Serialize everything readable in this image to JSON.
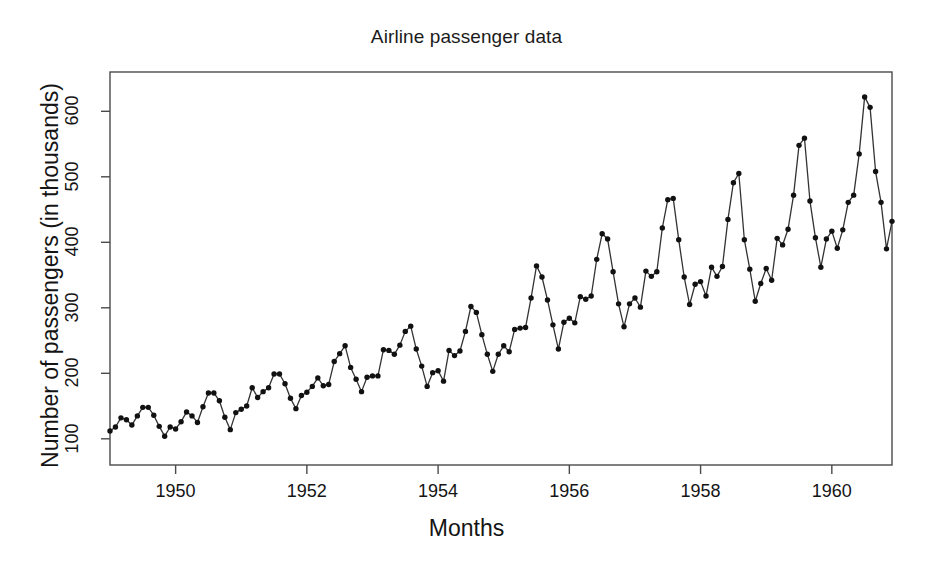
{
  "chart_data": {
    "type": "line",
    "title": "Airline passenger data",
    "xlabel": "Months",
    "ylabel": "Number of passengers (in thousands)",
    "grid": false,
    "legend": false,
    "marker": "filled-circle",
    "line_color": "#333333",
    "marker_color": "#111111",
    "xlim": [
      1949.0,
      1960.917
    ],
    "ylim": [
      60,
      660
    ],
    "xtick_values": [
      1950,
      1952,
      1954,
      1956,
      1958,
      1960
    ],
    "xtick_labels": [
      "1950",
      "1952",
      "1954",
      "1956",
      "1958",
      "1960"
    ],
    "ytick_values": [
      100,
      200,
      300,
      400,
      500,
      600
    ],
    "ytick_labels": [
      "100",
      "200",
      "300",
      "400",
      "500",
      "600"
    ],
    "x": [
      1949.0,
      1949.083,
      1949.167,
      1949.25,
      1949.333,
      1949.417,
      1949.5,
      1949.583,
      1949.667,
      1949.75,
      1949.833,
      1949.917,
      1950.0,
      1950.083,
      1950.167,
      1950.25,
      1950.333,
      1950.417,
      1950.5,
      1950.583,
      1950.667,
      1950.75,
      1950.833,
      1950.917,
      1951.0,
      1951.083,
      1951.167,
      1951.25,
      1951.333,
      1951.417,
      1951.5,
      1951.583,
      1951.667,
      1951.75,
      1951.833,
      1951.917,
      1952.0,
      1952.083,
      1952.167,
      1952.25,
      1952.333,
      1952.417,
      1952.5,
      1952.583,
      1952.667,
      1952.75,
      1952.833,
      1952.917,
      1953.0,
      1953.083,
      1953.167,
      1953.25,
      1953.333,
      1953.417,
      1953.5,
      1953.583,
      1953.667,
      1953.75,
      1953.833,
      1953.917,
      1954.0,
      1954.083,
      1954.167,
      1954.25,
      1954.333,
      1954.417,
      1954.5,
      1954.583,
      1954.667,
      1954.75,
      1954.833,
      1954.917,
      1955.0,
      1955.083,
      1955.167,
      1955.25,
      1955.333,
      1955.417,
      1955.5,
      1955.583,
      1955.667,
      1955.75,
      1955.833,
      1955.917,
      1956.0,
      1956.083,
      1956.167,
      1956.25,
      1956.333,
      1956.417,
      1956.5,
      1956.583,
      1956.667,
      1956.75,
      1956.833,
      1956.917,
      1957.0,
      1957.083,
      1957.167,
      1957.25,
      1957.333,
      1957.417,
      1957.5,
      1957.583,
      1957.667,
      1957.75,
      1957.833,
      1957.917,
      1958.0,
      1958.083,
      1958.167,
      1958.25,
      1958.333,
      1958.417,
      1958.5,
      1958.583,
      1958.667,
      1958.75,
      1958.833,
      1958.917,
      1959.0,
      1959.083,
      1959.167,
      1959.25,
      1959.333,
      1959.417,
      1959.5,
      1959.583,
      1959.667,
      1959.75,
      1959.833,
      1959.917,
      1960.0,
      1960.083,
      1960.167,
      1960.25,
      1960.333,
      1960.417,
      1960.5,
      1960.583,
      1960.667,
      1960.75,
      1960.833,
      1960.917
    ],
    "values": [
      112,
      118,
      132,
      129,
      121,
      135,
      148,
      148,
      136,
      119,
      104,
      118,
      115,
      126,
      141,
      135,
      125,
      149,
      170,
      170,
      158,
      133,
      114,
      140,
      145,
      150,
      178,
      163,
      172,
      178,
      199,
      199,
      184,
      162,
      146,
      166,
      171,
      180,
      193,
      181,
      183,
      218,
      230,
      242,
      209,
      191,
      172,
      194,
      196,
      196,
      236,
      235,
      229,
      243,
      264,
      272,
      237,
      211,
      180,
      201,
      204,
      188,
      235,
      227,
      234,
      264,
      302,
      293,
      259,
      229,
      203,
      229,
      242,
      233,
      267,
      269,
      270,
      315,
      364,
      347,
      312,
      274,
      237,
      278,
      284,
      277,
      317,
      313,
      318,
      374,
      413,
      405,
      355,
      306,
      271,
      306,
      315,
      301,
      356,
      348,
      355,
      422,
      465,
      467,
      404,
      347,
      305,
      336,
      340,
      318,
      362,
      348,
      363,
      435,
      491,
      505,
      404,
      359,
      310,
      337,
      360,
      342,
      406,
      396,
      420,
      472,
      548,
      559,
      463,
      407,
      362,
      405,
      417,
      391,
      419,
      461,
      472,
      535,
      622,
      606,
      508,
      461,
      390,
      432
    ],
    "series_name": "AirPassengers",
    "n_points": 144,
    "value_min": 104,
    "value_max": 622
  },
  "axes": {
    "title": "Airline passenger data",
    "x_axis_label": "Months",
    "y_axis_label": "Number of passengers (in thousands)"
  }
}
